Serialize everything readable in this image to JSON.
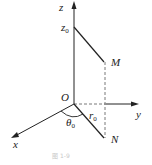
{
  "diagram": {
    "type": "3d-coordinate-cylindrical",
    "axes": {
      "z": {
        "label": "z"
      },
      "y": {
        "label": "y"
      },
      "x": {
        "label": "x"
      }
    },
    "points": {
      "origin": {
        "label": "O"
      },
      "M": {
        "label": "M"
      },
      "N": {
        "label": "N"
      },
      "z0": {
        "label": "z",
        "sub": "0"
      }
    },
    "annotations": {
      "theta": {
        "label": "θ",
        "sub": "0"
      },
      "r": {
        "label": "r",
        "sub": "0"
      }
    },
    "caption": "图 1-9",
    "colors": {
      "line": "#222222",
      "dashed": "#555555",
      "background": "#ffffff"
    }
  }
}
